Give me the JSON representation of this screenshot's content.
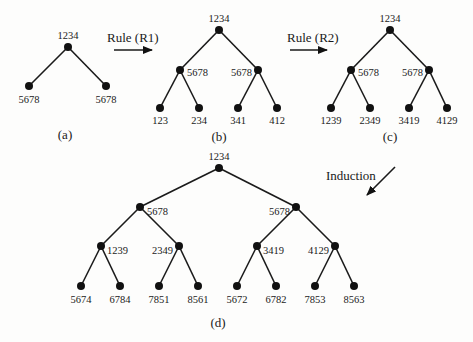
{
  "colors": {
    "ink": "#111111",
    "background": "#fdfdfc"
  },
  "arrows": {
    "r1": {
      "label": "Rule (R1)",
      "direction": "right"
    },
    "r2": {
      "label": "Rule (R2)",
      "direction": "right"
    },
    "induction": {
      "label": "Induction",
      "direction": "down-left"
    }
  },
  "trees": {
    "a": {
      "caption": "(a)",
      "root": "1234",
      "level1": [
        "5678",
        "5678"
      ]
    },
    "b": {
      "caption": "(b)",
      "root": "1234",
      "level1": [
        "5678",
        "5678"
      ],
      "level2": [
        "123",
        "234",
        "341",
        "412"
      ]
    },
    "c": {
      "caption": "(c)",
      "root": "1234",
      "level1": [
        "5678",
        "5678"
      ],
      "level2": [
        "1239",
        "2349",
        "3419",
        "4129"
      ]
    },
    "d": {
      "caption": "(d)",
      "root": "1234",
      "level1": [
        "5678",
        "5678"
      ],
      "level2": [
        "1239",
        "2349",
        "3419",
        "4129"
      ],
      "level3": [
        "5674",
        "6784",
        "7851",
        "8561",
        "5672",
        "6782",
        "7853",
        "8563"
      ]
    }
  }
}
